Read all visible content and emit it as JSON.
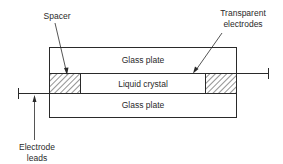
{
  "diagram": {
    "type": "liquid-crystal-cell-cross-section",
    "layers": [
      {
        "id": "top-glass",
        "label": "Glass plate"
      },
      {
        "id": "liquid-crystal",
        "label": "Liquid crystal"
      },
      {
        "id": "bottom-glass",
        "label": "Glass plate"
      }
    ],
    "callouts": {
      "spacer": "Spacer",
      "transparent_electrodes_line1": "Transparent",
      "transparent_electrodes_line2": "electrodes",
      "electrode_leads_line1": "Electrode",
      "electrode_leads_line2": "leads"
    },
    "colors": {
      "stroke": "#2a2a2a",
      "background": "#ffffff",
      "text": "#2a2a2a"
    }
  }
}
